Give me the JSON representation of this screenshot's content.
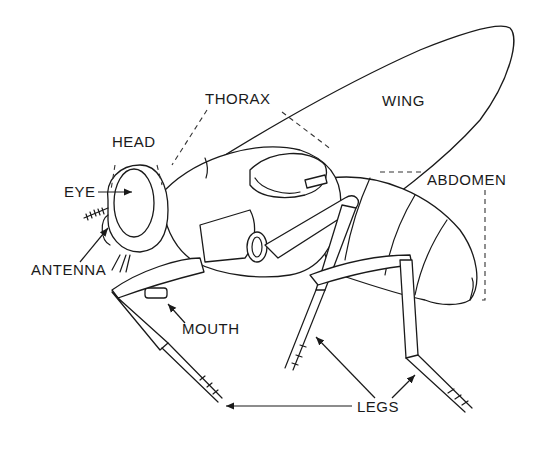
{
  "diagram": {
    "colors": {
      "ink": "#1a1a1a",
      "background": "#ffffff"
    },
    "labels": {
      "thorax": "THORAX",
      "wing": "WING",
      "head": "HEAD",
      "eye": "EYE",
      "abdomen": "ABDOMEN",
      "antenna": "ANTENNA",
      "mouth": "MOUTH",
      "legs": "LEGS"
    }
  }
}
